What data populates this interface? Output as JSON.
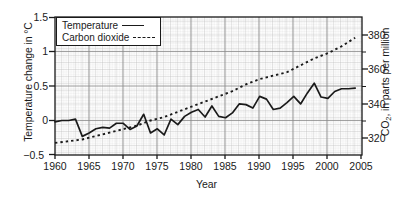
{
  "chart_data": {
    "type": "line",
    "title": "",
    "xlabel": "Year",
    "ylabel_left": "Temperature change in °C",
    "ylabel_right_pre": "CO",
    "ylabel_right_sub": "2",
    "ylabel_right_post": ", in parts per million",
    "xlim": [
      1960,
      2005
    ],
    "ylim_left": [
      -0.5,
      1.5
    ],
    "ylim_right": [
      310,
      390
    ],
    "grid": true,
    "grid_minor": true,
    "legend_position": "top-left",
    "xticks": [
      "1960",
      "1965",
      "1970",
      "1975",
      "1980",
      "1985",
      "1990",
      "1995",
      "2000",
      "2005"
    ],
    "yticks_left": [
      "1.5",
      "1",
      "0.5",
      "0",
      "−0.5"
    ],
    "yticks_right": [
      "380",
      "360",
      "340",
      "320"
    ],
    "series": [
      {
        "name": "Temperature",
        "legend_label": "Temperature",
        "style": "solid",
        "axis": "left",
        "units": "°C",
        "x": [
          1960,
          1961,
          1962,
          1963,
          1964,
          1965,
          1966,
          1967,
          1968,
          1969,
          1970,
          1971,
          1972,
          1973,
          1974,
          1975,
          1976,
          1977,
          1978,
          1979,
          1980,
          1981,
          1982,
          1983,
          1984,
          1985,
          1986,
          1987,
          1988,
          1989,
          1990,
          1991,
          1992,
          1993,
          1994,
          1995,
          1996,
          1997,
          1998,
          1999,
          2000,
          2001,
          2002,
          2003,
          2004
        ],
        "values": [
          -0.02,
          0.0,
          0.0,
          0.02,
          -0.23,
          -0.18,
          -0.12,
          -0.1,
          -0.11,
          -0.04,
          -0.04,
          -0.13,
          -0.08,
          0.09,
          -0.18,
          -0.12,
          -0.21,
          0.02,
          -0.06,
          0.06,
          0.12,
          0.16,
          0.05,
          0.21,
          0.06,
          0.04,
          0.11,
          0.24,
          0.23,
          0.18,
          0.35,
          0.31,
          0.16,
          0.18,
          0.26,
          0.35,
          0.24,
          0.4,
          0.54,
          0.34,
          0.32,
          0.42,
          0.46,
          0.46,
          0.47
        ]
      },
      {
        "name": "Carbon dioxide",
        "legend_label": "Carbon dioxide",
        "style": "dashed",
        "axis": "right",
        "units": "ppm",
        "x": [
          1960,
          1962,
          1964,
          1966,
          1968,
          1970,
          1972,
          1974,
          1976,
          1978,
          1980,
          1982,
          1984,
          1986,
          1988,
          1990,
          1992,
          1994,
          1996,
          1998,
          2000,
          2002,
          2004
        ],
        "values": [
          317,
          318,
          319,
          321,
          323,
          325,
          327,
          330,
          332,
          335,
          338,
          341,
          344,
          347,
          351,
          354,
          356,
          358,
          362,
          366,
          369,
          373,
          378
        ]
      }
    ]
  }
}
